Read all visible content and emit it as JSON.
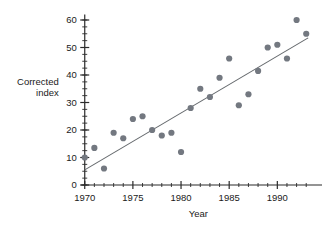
{
  "chart_data": {
    "type": "scatter",
    "title": "",
    "xlabel": "Year",
    "ylabel": "Corrected index",
    "ylabel_line1": "Corrected",
    "ylabel_line2": "index",
    "xlim": [
      1969.3,
      1993.6
    ],
    "ylim": [
      0,
      62
    ],
    "xticks": [
      1970,
      1975,
      1980,
      1985,
      1990
    ],
    "xtick_labels": [
      "1970",
      "1975",
      "1980",
      "1985",
      "1990"
    ],
    "xminor_step": 1,
    "yticks": [
      0,
      10,
      20,
      30,
      40,
      50,
      60
    ],
    "ytick_labels": [
      "0",
      "10",
      "20",
      "30",
      "40",
      "50",
      "60"
    ],
    "yminor_step": 2.5,
    "grid": false,
    "legend": false,
    "point_color": "#737880",
    "line_color": "#666a6e",
    "axis_color": "#2b2b2b",
    "x": [
      1970,
      1971,
      1972,
      1973,
      1974,
      1975,
      1976,
      1977,
      1978,
      1979,
      1980,
      1981,
      1982,
      1983,
      1984,
      1985,
      1986,
      1987,
      1988,
      1989,
      1990,
      1991,
      1992,
      1993
    ],
    "y": [
      10,
      13.5,
      6,
      19,
      17,
      24,
      25,
      20,
      18,
      19,
      12,
      28,
      35,
      32,
      39,
      46,
      29,
      33,
      41.5,
      50,
      51,
      46,
      60,
      55
    ],
    "points": [
      {
        "x": 1970,
        "y": 10
      },
      {
        "x": 1971,
        "y": 13.5
      },
      {
        "x": 1972,
        "y": 6
      },
      {
        "x": 1973,
        "y": 19
      },
      {
        "x": 1974,
        "y": 17
      },
      {
        "x": 1975,
        "y": 24
      },
      {
        "x": 1976,
        "y": 25
      },
      {
        "x": 1977,
        "y": 20
      },
      {
        "x": 1978,
        "y": 18
      },
      {
        "x": 1979,
        "y": 19
      },
      {
        "x": 1980,
        "y": 12
      },
      {
        "x": 1981,
        "y": 28
      },
      {
        "x": 1982,
        "y": 35
      },
      {
        "x": 1983,
        "y": 32
      },
      {
        "x": 1984,
        "y": 39
      },
      {
        "x": 1985,
        "y": 46
      },
      {
        "x": 1986,
        "y": 29
      },
      {
        "x": 1987,
        "y": 33
      },
      {
        "x": 1988,
        "y": 41.5
      },
      {
        "x": 1989,
        "y": 50
      },
      {
        "x": 1990,
        "y": 51
      },
      {
        "x": 1991,
        "y": 46
      },
      {
        "x": 1992,
        "y": 60
      },
      {
        "x": 1993,
        "y": 55
      }
    ],
    "trendline": {
      "name": "least-squares fit",
      "x_start": 1970,
      "y_start": 5.5,
      "x_end": 1993.2,
      "y_end": 53.5
    }
  }
}
